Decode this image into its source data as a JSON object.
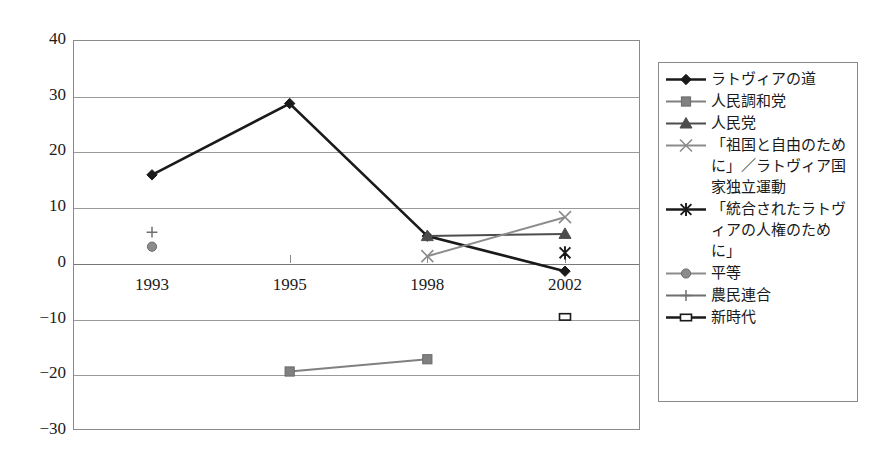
{
  "chart_data": {
    "type": "line",
    "title": "",
    "xlabel": "",
    "ylabel": "",
    "categories": [
      "1993",
      "1995",
      "1998",
      "2002"
    ],
    "ylim": [
      -30,
      40
    ],
    "ytick_values": [
      40,
      30,
      20,
      10,
      0,
      -10,
      -20,
      -30
    ],
    "ytick_labels": [
      "40",
      "30",
      "20",
      "10",
      "0",
      "−10",
      "−20",
      "−30"
    ],
    "grid": true,
    "legend_position": "right",
    "series": [
      {
        "name": "ラトヴィアの道",
        "marker": "diamond",
        "color": "#1a1a1a",
        "values": [
          15.8,
          28.6,
          4.8,
          -1.5
        ]
      },
      {
        "name": "人民調和党",
        "marker": "square",
        "color": "#808080",
        "values": [
          null,
          -19.5,
          -17.3,
          null
        ]
      },
      {
        "name": "人民党",
        "marker": "triangle",
        "color": "#4d4d4d",
        "values": [
          null,
          null,
          4.8,
          5.2
        ]
      },
      {
        "name": "「祖国と自由のために」／ラトヴィア国家独立運動",
        "marker": "x",
        "color": "#8c8c8c",
        "values": [
          null,
          null,
          1.2,
          8.2
        ]
      },
      {
        "name": "「統合されたラトヴィアの人権のために」",
        "marker": "asterisk",
        "color": "#1a1a1a",
        "values": [
          null,
          null,
          null,
          1.8
        ]
      },
      {
        "name": "平等",
        "marker": "circle",
        "color": "#8c8c8c",
        "values": [
          2.9,
          null,
          null,
          null
        ]
      },
      {
        "name": "農民連合",
        "marker": "plus",
        "color": "#6f6f6f",
        "values": [
          5.5,
          null,
          null,
          null
        ]
      },
      {
        "name": "新時代",
        "marker": "open-rect",
        "color": "#1a1a1a",
        "values": [
          null,
          null,
          null,
          -9.7
        ]
      }
    ]
  },
  "legend": {
    "items": [
      {
        "label": "ラトヴィアの道"
      },
      {
        "label": "人民調和党"
      },
      {
        "label": "人民党"
      },
      {
        "label": "「祖国と自由のために」／ラトヴィア国家独立運動"
      },
      {
        "label": "「統合されたラトヴィアの人権のために」"
      },
      {
        "label": "平等"
      },
      {
        "label": "農民連合"
      },
      {
        "label": "新時代"
      }
    ]
  }
}
